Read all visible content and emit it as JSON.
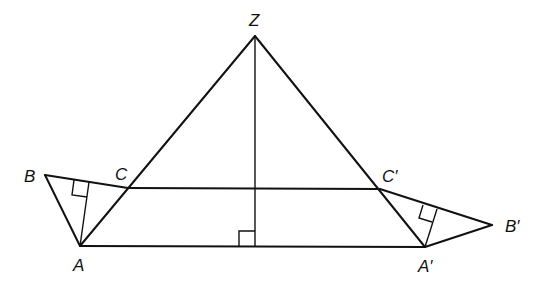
{
  "diagram": {
    "type": "geometry",
    "colors": {
      "stroke": "#111111",
      "background": "#ffffff"
    },
    "points": {
      "Z": {
        "label": "Z",
        "x": 255,
        "y": 36
      },
      "A": {
        "label": "A",
        "x": 80,
        "y": 246
      },
      "A2": {
        "label": "A′",
        "x": 425,
        "y": 247
      },
      "B": {
        "label": "B",
        "x": 45,
        "y": 175
      },
      "B2": {
        "label": "B′",
        "x": 492,
        "y": 225
      },
      "C": {
        "label": "C",
        "x": 128,
        "y": 188
      },
      "C2": {
        "label": "C′",
        "x": 380,
        "y": 189
      },
      "H": {
        "label": "",
        "x": 255,
        "y": 246
      }
    },
    "segments": [
      [
        "Z",
        "A"
      ],
      [
        "Z",
        "A2"
      ],
      [
        "A",
        "A2"
      ],
      [
        "Z",
        "H"
      ],
      [
        "C",
        "C2"
      ],
      [
        "B",
        "C"
      ],
      [
        "B",
        "A"
      ],
      [
        "C2",
        "B2"
      ],
      [
        "B2",
        "A2"
      ]
    ],
    "right_angles": [
      "foot of Z on AA'",
      "foot of A on BC",
      "foot of A' on C'B'"
    ],
    "labels": {
      "Z": "Z",
      "A": "A",
      "A2": "A′",
      "B": "B",
      "B2": "B′",
      "C": "C",
      "C2": "C′"
    }
  }
}
